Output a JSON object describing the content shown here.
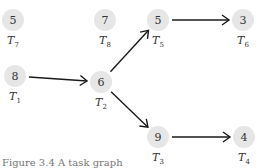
{
  "diagram": {
    "type": "directed task graph",
    "nodes": [
      {
        "id": "T1",
        "label": "T",
        "sub": "1",
        "value": "8",
        "x": 15,
        "y": 76
      },
      {
        "id": "T2",
        "label": "T",
        "sub": "2",
        "value": "6",
        "x": 101,
        "y": 82
      },
      {
        "id": "T3",
        "label": "T",
        "sub": "3",
        "value": "9",
        "x": 158,
        "y": 137
      },
      {
        "id": "T4",
        "label": "T",
        "sub": "4",
        "value": "4",
        "x": 244,
        "y": 137
      },
      {
        "id": "T5",
        "label": "T",
        "sub": "5",
        "value": "5",
        "x": 158,
        "y": 20
      },
      {
        "id": "T6",
        "label": "T",
        "sub": "6",
        "value": "3",
        "x": 243,
        "y": 20
      },
      {
        "id": "T7",
        "label": "T",
        "sub": "7",
        "value": "5",
        "x": 13,
        "y": 20
      },
      {
        "id": "T8",
        "label": "T",
        "sub": "8",
        "value": "7",
        "x": 105,
        "y": 20
      }
    ],
    "edges": [
      {
        "from": "T1",
        "to": "T2"
      },
      {
        "from": "T2",
        "to": "T5"
      },
      {
        "from": "T2",
        "to": "T3"
      },
      {
        "from": "T5",
        "to": "T6"
      },
      {
        "from": "T3",
        "to": "T4"
      }
    ],
    "colors": {
      "node_fill": "#e6e6e6",
      "edge": "#1a1a1a",
      "text": "#333333"
    }
  },
  "caption": "Figure 3.4  A task graph"
}
